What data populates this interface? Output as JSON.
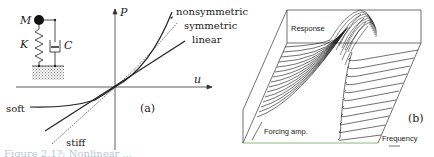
{
  "panel_a": {
    "label": "(a)",
    "model": {
      "mass": "M",
      "spring": "K",
      "damper": "C"
    },
    "axes": {
      "x": "u",
      "y": "P"
    },
    "curves": {
      "nonsymmetric": "nonsymmetric",
      "symmetric": "symmetric",
      "linear": "linear",
      "soft": "soft",
      "stiff": "stiff"
    }
  },
  "panel_b": {
    "label": "(b)",
    "axes": {
      "z": "Response",
      "y": "Forcing amp.",
      "x": "Frequency"
    }
  },
  "caption": "Figure 2.1?: Nonlinear ..."
}
